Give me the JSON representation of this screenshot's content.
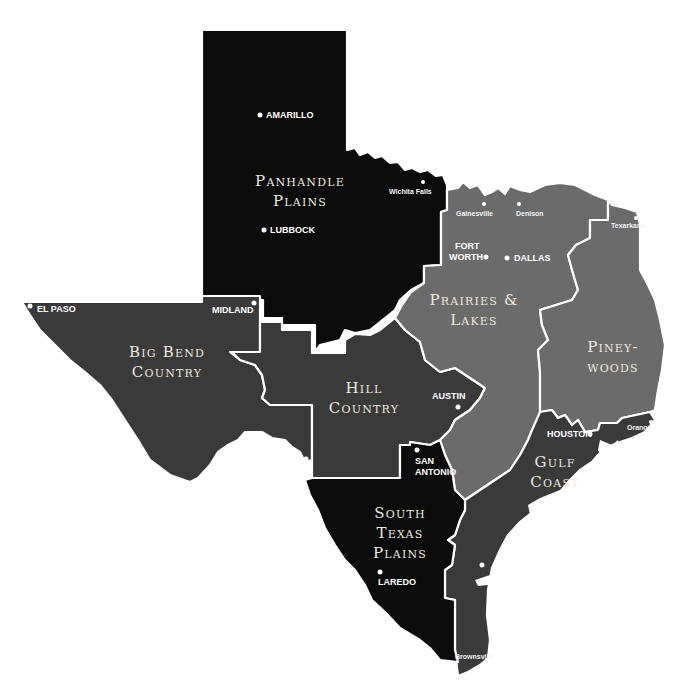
{
  "map": {
    "title": "Texas Travel Regions",
    "colors": {
      "background": "#ffffff",
      "dark_region": "#0b0b0b",
      "medium_region": "#3a3a3a",
      "light_region": "#6b6b6b",
      "border": "#ffffff"
    },
    "regions": [
      {
        "id": "panhandle-plains",
        "line1": "Panhandle",
        "line2": "Plains",
        "shade": "dark"
      },
      {
        "id": "big-bend-country",
        "line1": "Big Bend",
        "line2": "Country",
        "shade": "medium"
      },
      {
        "id": "hill-country",
        "line1": "Hill",
        "line2": "Country",
        "shade": "medium"
      },
      {
        "id": "prairies-lakes",
        "line1": "Prairies &",
        "line2": "Lakes",
        "shade": "light"
      },
      {
        "id": "piney-woods",
        "line1": "Piney-",
        "line2": "woods",
        "shade": "light"
      },
      {
        "id": "gulf-coast",
        "line1": "Gulf",
        "line2": "Coast",
        "shade": "medium"
      },
      {
        "id": "south-texas-plains",
        "line1": "South",
        "line2": "Texas",
        "line3": "Plains",
        "shade": "dark"
      }
    ],
    "cities": {
      "amarillo": "AMARILLO",
      "lubbock": "LUBBOCK",
      "wichita_falls": "Wichita Falls",
      "gainesville": "Gainesville",
      "denison": "Denison",
      "texarkana": "Texarkana",
      "fort_worth_1": "FORT",
      "fort_worth_2": "WORTH",
      "dallas": "DALLAS",
      "el_paso": "EL PASO",
      "midland": "MIDLAND",
      "austin": "AUSTIN",
      "houston": "HOUSTON",
      "orange": "Orange",
      "del_rio": "DEL RIO",
      "san_antonio_1": "SAN",
      "san_antonio_2": "ANTONIO",
      "laredo": "LAREDO",
      "corpus_christi_1": "CORPUS",
      "corpus_christi_2": "CHRISTI",
      "brownsville": "Brownsville"
    }
  }
}
